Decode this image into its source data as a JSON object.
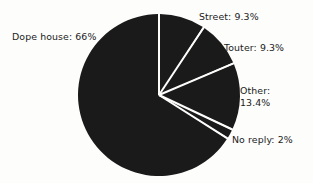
{
  "chart_data": {
    "type": "pie",
    "title": "",
    "subtitle": "",
    "xlabel": "",
    "ylabel": "",
    "legend_position": "none",
    "grid": false,
    "units": "percent",
    "start_angle_deg": 0,
    "direction": "clockwise",
    "categories": [
      "Street",
      "Touter",
      "Other",
      "No reply",
      "Dope house"
    ],
    "values": [
      9.3,
      9.3,
      13.4,
      2,
      66
    ],
    "labels": [
      "Street: 9.3%",
      "Touter: 9.3%",
      "Other:\n13.4%",
      "No reply: 2%",
      "Dope house: 66%"
    ],
    "slices": [
      {
        "name": "Street",
        "value": 9.3,
        "label": "Street: 9.3%",
        "color": "#1a1a1a",
        "start_deg": 0.0,
        "end_deg": 33.5
      },
      {
        "name": "Touter",
        "value": 9.3,
        "label": "Touter: 9.3%",
        "color": "#1a1a1a",
        "start_deg": 33.5,
        "end_deg": 67.0
      },
      {
        "name": "Other",
        "value": 13.4,
        "label": "Other: 13.4%",
        "color": "#1a1a1a",
        "start_deg": 67.0,
        "end_deg": 115.2
      },
      {
        "name": "No reply",
        "value": 2,
        "label": "No reply: 2%",
        "color": "#1a1a1a",
        "start_deg": 115.2,
        "end_deg": 122.4
      },
      {
        "name": "Dope house",
        "value": 66,
        "label": "Dope house: 66%",
        "color": "#1a1a1a",
        "start_deg": 122.4,
        "end_deg": 360.0
      }
    ]
  },
  "labels": {
    "dope_house": "Dope house: 66%",
    "street": "Street: 9.3%",
    "touter": "Touter: 9.3%",
    "other_line1": "Other:",
    "other_line2": "13.4%",
    "no_reply": "No reply: 2%"
  },
  "colors": {
    "background": "#fdfdfc",
    "slice_fill": "#1a1a1a",
    "slice_separator": "#fdfdfc",
    "text": "#1b1b1b"
  }
}
